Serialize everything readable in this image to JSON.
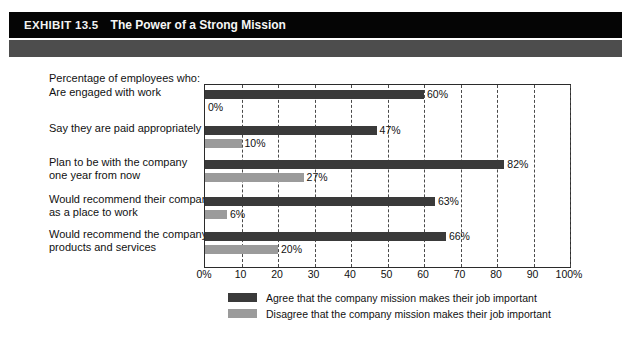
{
  "exhibit": {
    "number": "EXHIBIT 13.5",
    "title": "The Power of a Strong Mission"
  },
  "chart_data": {
    "type": "bar",
    "orientation": "horizontal",
    "title": "The Power of a Strong Mission",
    "caption": "Percentage of employees who:",
    "xlabel": "",
    "ylabel": "",
    "xlim": [
      0,
      100
    ],
    "grid": true,
    "grid_axis": "x",
    "legend_position": "bottom",
    "categories": [
      "Are engaged with work",
      "Say they are paid appropriately",
      "Plan to be with the company one year from now",
      "Would recommend their company as a place to work",
      "Would recommend the company's products and services"
    ],
    "category_lines": [
      [
        "Are engaged with work"
      ],
      [
        "Say they are paid appropriately"
      ],
      [
        "Plan to be with the company",
        "one year from now"
      ],
      [
        "Would recommend their company",
        "as a place to work"
      ],
      [
        "Would recommend the company's",
        "products and services"
      ]
    ],
    "series": [
      {
        "name": "Agree that the company mission makes their job important",
        "color": "#3a3a3a",
        "values": [
          60,
          47,
          82,
          63,
          66
        ],
        "labels": [
          "60%",
          "47%",
          "82%",
          "63%",
          "66%"
        ]
      },
      {
        "name": "Disagree that the company mission makes their job important",
        "color": "#9b9b9b",
        "values": [
          0,
          10,
          27,
          6,
          20
        ],
        "labels": [
          "0%",
          "10%",
          "27%",
          "6%",
          "20%"
        ]
      }
    ],
    "xticks": [
      0,
      10,
      20,
      30,
      40,
      50,
      60,
      70,
      80,
      90,
      100
    ],
    "xtick_labels": [
      "0%",
      "10",
      "20",
      "30",
      "40",
      "50",
      "60",
      "70",
      "80",
      "90",
      "100%"
    ]
  },
  "legend": {
    "items": [
      {
        "label": "Agree that the company mission makes their job important",
        "color": "#3a3a3a"
      },
      {
        "label": "Disagree that the company mission makes their job important",
        "color": "#9b9b9b"
      }
    ]
  },
  "colors": {
    "header_bar": "#050505",
    "sub_band": "#4d4d4d",
    "agree": "#3a3a3a",
    "disagree": "#9b9b9b",
    "plot_border": "#2b2b2b",
    "gridline": "#4a4a4a"
  }
}
